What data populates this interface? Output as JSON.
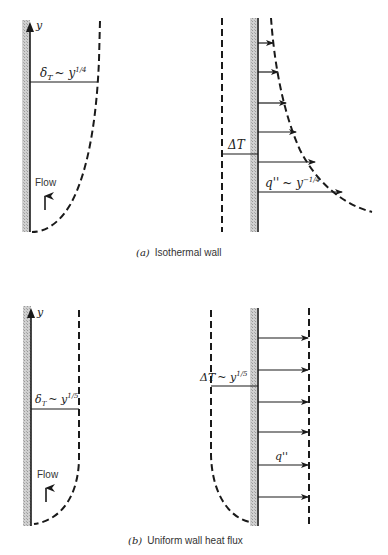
{
  "figure": {
    "panel_a": {
      "caption_label": "(a)",
      "caption_text": "Isothermal wall",
      "left": {
        "axis_label": "y",
        "boundary_layer_label": "δ",
        "boundary_layer_sub": "T",
        "boundary_layer_rel": "~ y",
        "boundary_layer_exp": "1/4",
        "flow_label": "Flow"
      },
      "right": {
        "delta_t_label": "ΔT",
        "heat_flux_label": "q''",
        "heat_flux_rel": "~ y",
        "heat_flux_exp": "−1/4"
      }
    },
    "panel_b": {
      "caption_label": "(b)",
      "caption_text": "Uniform wall heat flux",
      "left": {
        "axis_label": "y",
        "boundary_layer_label": "δ",
        "boundary_layer_sub": "T",
        "boundary_layer_rel": "~ y",
        "boundary_layer_exp": "1/5",
        "flow_label": "Flow"
      },
      "right": {
        "delta_t_label": "ΔT",
        "delta_t_rel": "~ y",
        "delta_t_exp": "1/5",
        "heat_flux_label": "q''"
      }
    }
  }
}
